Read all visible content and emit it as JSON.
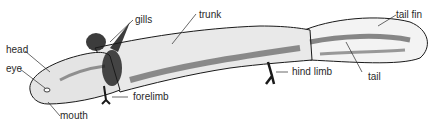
{
  "figure": {
    "labels": {
      "head": "head",
      "eye": "eye",
      "mouth": "mouth",
      "gills": "gills",
      "forelimb": "forelimb",
      "trunk": "trunk",
      "hind_limb": "hind limb",
      "tail_fin": "tail fin",
      "tail": "tail"
    },
    "colors": {
      "ink": "#1a1a1a",
      "label": "#2a2a2a",
      "background": "#ffffff"
    }
  }
}
